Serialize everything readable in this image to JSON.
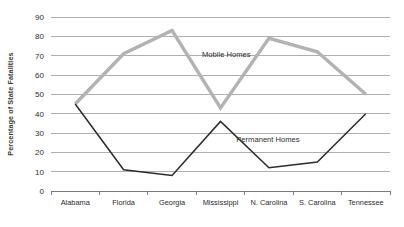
{
  "chart_data": {
    "type": "line",
    "title": "",
    "xlabel": "",
    "ylabel": "Percentage of State Fatalities",
    "ylim": [
      0,
      90
    ],
    "yticks": [
      0,
      10,
      20,
      30,
      40,
      50,
      60,
      70,
      80,
      90
    ],
    "grid": true,
    "legend_position": "inline-annotation",
    "categories": [
      "Alabama",
      "Florida",
      "Georgia",
      "Mississippi",
      "N. Carolina",
      "S. Carolina",
      "Tennessee"
    ],
    "series": [
      {
        "name": "Mobile Homes",
        "color": "#b3b3b3",
        "values": [
          45,
          71,
          83,
          43,
          79,
          72,
          50
        ]
      },
      {
        "name": "Permanent Homes",
        "color": "#2b2b2b",
        "values": [
          45,
          11,
          8,
          36,
          12,
          15,
          40
        ]
      }
    ],
    "annotations": [
      {
        "text": "Mobile Homes",
        "x_value": 3.62,
        "y_value": 69.5
      },
      {
        "text": "Permanent Homes",
        "x_value": 4.48,
        "y_value": 25.5
      }
    ]
  },
  "axis": {
    "y_tick_labels": [
      "0",
      "10",
      "20",
      "30",
      "40",
      "50",
      "60",
      "70",
      "80",
      "90"
    ],
    "y_title": "Percentage of State Fatalities",
    "x_tick_labels": [
      "Alabama",
      "Florida",
      "Georgia",
      "Mississippi",
      "N. Carolina",
      "S. Carolina",
      "Tennessee"
    ]
  }
}
